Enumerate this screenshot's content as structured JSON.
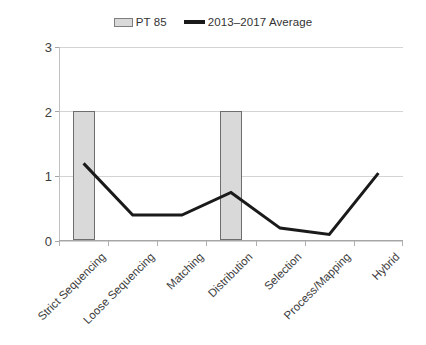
{
  "legend": {
    "position": "top-center",
    "entries": [
      {
        "label": "PT 85",
        "marker": "bar-swatch-icon",
        "color": "#d9d9d9"
      },
      {
        "label": "2013–2017 Average",
        "marker": "line-swatch-icon",
        "color": "#1a1a1a"
      }
    ]
  },
  "axes": {
    "y_ticks": [
      "0",
      "1",
      "2",
      "3"
    ],
    "x_labels": [
      "Strict Sequencing",
      "Loose Sequencing",
      "Matching",
      "Distribution",
      "Selection",
      "Process/Mapping",
      "Hybrid"
    ]
  },
  "chart_data": {
    "type": "bar",
    "title": "",
    "subtitle": "",
    "xlabel": "",
    "ylabel": "",
    "categories": [
      "Strict Sequencing",
      "Loose Sequencing",
      "Matching",
      "Distribution",
      "Selection",
      "Process/Mapping",
      "Hybrid"
    ],
    "series": [
      {
        "name": "PT 85",
        "type": "bar",
        "color": "#d9d9d9",
        "edge_color": "#6e6e6e",
        "values": [
          2,
          0,
          0,
          2,
          0,
          0,
          0
        ]
      },
      {
        "name": "2013–2017 Average",
        "type": "line",
        "color": "#1a1a1a",
        "line_width": 3,
        "values": [
          1.2,
          0.4,
          0.4,
          0.75,
          0.2,
          0.1,
          1.05
        ]
      }
    ],
    "ylim": [
      0,
      3
    ],
    "yticks": [
      0,
      1,
      2,
      3
    ],
    "grid": "horizontal",
    "legend_position": "top"
  }
}
